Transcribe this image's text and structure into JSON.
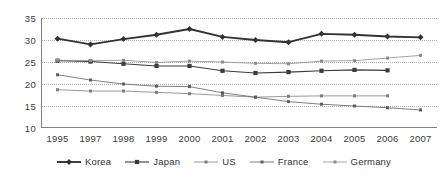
{
  "chart_data": {
    "type": "line",
    "title": "",
    "xlabel": "",
    "ylabel": "",
    "categories": [
      "1995",
      "1997",
      "1998",
      "1999",
      "2000",
      "2001",
      "2002",
      "2003",
      "2004",
      "2005",
      "2006",
      "2007"
    ],
    "ylim": [
      10,
      35
    ],
    "yticks": [
      10,
      15,
      20,
      25,
      30,
      35
    ],
    "grid": true,
    "legend_position": "bottom",
    "series": [
      {
        "name": "Korea",
        "marker": "diamond",
        "line_style": "solid",
        "line_width": "thick",
        "color": "#333333",
        "values": [
          30.3,
          29.0,
          30.2,
          31.2,
          32.5,
          30.7,
          30.0,
          29.5,
          31.4,
          31.2,
          30.8,
          30.6
        ]
      },
      {
        "name": "Japan",
        "marker": "square",
        "line_style": "solid",
        "line_width": "medium",
        "color": "#3b3b3b",
        "values": [
          25.3,
          25.1,
          24.6,
          24.1,
          24.1,
          23.0,
          22.5,
          22.7,
          23.0,
          23.2,
          23.1,
          null
        ]
      },
      {
        "name": "US",
        "marker": "small-square",
        "line_style": "solid",
        "line_width": "thin",
        "color": "#7d7d7d",
        "values": [
          18.7,
          18.4,
          18.4,
          18.1,
          17.8,
          17.4,
          17.0,
          17.2,
          17.3,
          17.3,
          17.3,
          null
        ]
      },
      {
        "name": "France",
        "marker": "small-square",
        "line_style": "solid",
        "line_width": "thin",
        "color": "#5e5e5e",
        "values": [
          22.1,
          20.9,
          20.0,
          19.5,
          19.4,
          18.0,
          17.0,
          16.0,
          15.4,
          15.0,
          14.6,
          14.1
        ]
      },
      {
        "name": "Germany",
        "marker": "small-square",
        "line_style": "solid",
        "line_width": "thin",
        "color": "#8c8c8c",
        "values": [
          25.4,
          25.3,
          25.4,
          24.9,
          25.2,
          25.0,
          24.7,
          24.6,
          25.2,
          25.3,
          25.9,
          26.5
        ]
      }
    ]
  }
}
